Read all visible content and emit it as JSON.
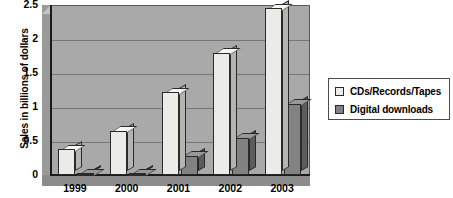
{
  "chart_data": {
    "type": "bar",
    "title": "",
    "subtitle": "",
    "xlabel": "",
    "ylabel": "Sales in billions of dollars",
    "categories": [
      "1999",
      "2000",
      "2001",
      "2002",
      "2003"
    ],
    "series": [
      {
        "name": "CDs/Records/Tapes",
        "color": "#ebebe8",
        "values": [
          0.38,
          0.65,
          1.22,
          1.8,
          2.45
        ]
      },
      {
        "name": "Digital downloads",
        "color": "#828282",
        "values": [
          0.01,
          0.02,
          0.28,
          0.55,
          1.05
        ]
      }
    ],
    "ylim": [
      0,
      2.5
    ],
    "y_ticks": [
      "0",
      "0.5",
      "1",
      "1.5",
      "2",
      "2.5"
    ],
    "y_tick_values": [
      0,
      0.5,
      1,
      1.5,
      2,
      2.5
    ],
    "grid": true,
    "grid_axis": "y",
    "legend_position": "right",
    "style": "3d-column",
    "plot_background": "#a9a9a9",
    "legend_background": "#ffffff"
  },
  "legend": {
    "items": [
      {
        "label": "CDs/Records/Tapes",
        "swatch": "light"
      },
      {
        "label": "Digital downloads",
        "swatch": "dark"
      }
    ]
  }
}
